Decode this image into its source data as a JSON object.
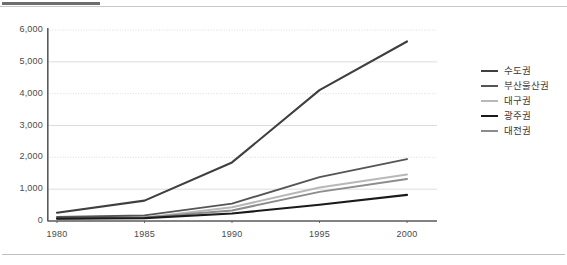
{
  "chart_data": {
    "type": "line",
    "title": "",
    "xlabel": "",
    "ylabel": "",
    "x": [
      1980,
      1985,
      1990,
      1995,
      2000
    ],
    "categories": [
      "1980",
      "1985",
      "1990",
      "1995",
      "2000"
    ],
    "xtick_labels": [
      "1980",
      "1985",
      "1990",
      "1995",
      "2000"
    ],
    "ytick_labels": [
      "0",
      "1,000",
      "2,000",
      "3,000",
      "4,000",
      "5,000",
      "6,000"
    ],
    "ytick_values": [
      0,
      1000,
      2000,
      3000,
      4000,
      5000,
      6000
    ],
    "ylim": [
      0,
      6000
    ],
    "xlim": [
      1980,
      2000
    ],
    "grid": true,
    "grid_axis": "y",
    "legend_position": "right",
    "series": [
      {
        "name": "수도권",
        "color": "#3f3f3f",
        "width": 2.1,
        "values": [
          260,
          640,
          1840,
          4110,
          5640
        ]
      },
      {
        "name": "부산울산권",
        "color": "#555555",
        "width": 1.9,
        "values": [
          130,
          175,
          545,
          1380,
          1945
        ]
      },
      {
        "name": "대구권",
        "color": "#b8b8b8",
        "width": 2.0,
        "values": [
          80,
          105,
          430,
          1055,
          1460
        ]
      },
      {
        "name": "광주권",
        "color": "#1a1a1a",
        "width": 2.1,
        "values": [
          75,
          90,
          235,
          510,
          820
        ]
      },
      {
        "name": "대전권",
        "color": "#8c8c8c",
        "width": 2.0,
        "values": [
          80,
          110,
          330,
          915,
          1320
        ]
      }
    ]
  },
  "legend": {
    "items": [
      {
        "label": "수도권",
        "color": "#3f3f3f",
        "width": 2.4
      },
      {
        "label": "부산울산권",
        "color": "#555555",
        "width": 2.2
      },
      {
        "label": "대구권",
        "color": "#b8b8b8",
        "width": 2.2
      },
      {
        "label": "광주권",
        "color": "#1a1a1a",
        "width": 2.6
      },
      {
        "label": "대전권",
        "color": "#8c8c8c",
        "width": 2.2
      }
    ]
  },
  "axis": {
    "y_labels": [
      "6,000",
      "5,000",
      "4,000",
      "3,000",
      "2,000",
      "1,000",
      "0"
    ],
    "x_labels": [
      "1980",
      "1985",
      "1990",
      "1995",
      "2000"
    ]
  },
  "colors": {
    "axis_line": "#5a5a5a",
    "grid_line": "#d9d9d9",
    "tick_text": "#4a4a4a",
    "legend_text": "#3b3b3b",
    "rule_dark": "#6e6e6e",
    "rule_thin": "#c8c8c8",
    "background": "#ffffff"
  }
}
